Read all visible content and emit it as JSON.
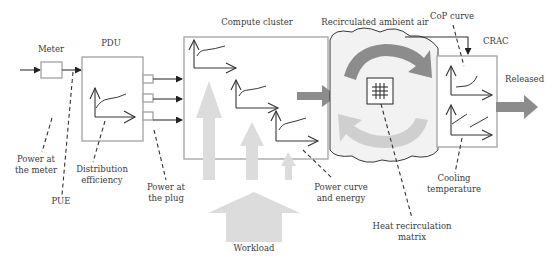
{
  "diagram": {
    "nodes": {
      "meter": "Meter",
      "pdu": "PDU",
      "compute_cluster": "Compute cluster",
      "ambient_air": "Recirculated ambient air",
      "crac": "CRAC",
      "released": "Released",
      "workload": "Workload"
    },
    "annotations": {
      "power_at_meter_1": "Power at",
      "power_at_meter_2": "the meter",
      "pue": "PUE",
      "distribution_efficiency_1": "Distribution",
      "distribution_efficiency_2": "efficiency",
      "power_at_plug_1": "Power at",
      "power_at_plug_2": "the plug",
      "power_curve_1": "Power curve",
      "power_curve_2": "and energy",
      "heat_recirculation_1": "Heat recirculation",
      "heat_recirculation_2": "matrix",
      "cop_curve": "CoP curve",
      "cooling_temperature_1": "Cooling",
      "cooling_temperature_2": "temperature"
    },
    "colors": {
      "box_border": "#a8a8a8",
      "dark_arrow": "#8c8c8c",
      "light_arrow": "#d4d4d4",
      "cloud_fill": "#f2f2f2",
      "workload_arrow": "#dcdcdc",
      "line": "#333333"
    }
  }
}
